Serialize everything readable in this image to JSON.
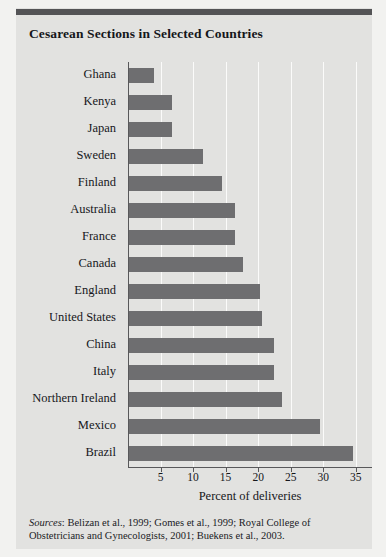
{
  "title": "Cesarean Sections in Selected Countries",
  "sources": {
    "label": "Sources",
    "text": ": Belizan et al., 1999; Gomes et al., 1999; Royal College of Obstetricians and Gynecologists, 2001; Buekens et al., 2003."
  },
  "colors": {
    "bar": "#6e6e70",
    "panel": "#e2e2e0",
    "page": "#f2f2f0",
    "rule": "#545456",
    "gridline": "#fbfbfa",
    "axis": "#58585a",
    "text": "#16171b"
  },
  "chart_data": {
    "type": "bar",
    "orientation": "horizontal",
    "title": "Cesarean Sections in Selected Countries",
    "xlabel": "Percent of deliveries",
    "ylabel": "",
    "xlim": [
      0,
      37.5
    ],
    "xticks": [
      5,
      10,
      15,
      20,
      25,
      30,
      35
    ],
    "grid": true,
    "legend": "none",
    "categories": [
      "Ghana",
      "Kenya",
      "Japan",
      "Sweden",
      "Finland",
      "Australia",
      "France",
      "Canada",
      "England",
      "United States",
      "China",
      "Italy",
      "Northern Ireland",
      "Mexico",
      "Brazil"
    ],
    "values": [
      4.0,
      6.8,
      6.8,
      11.5,
      14.5,
      16.5,
      16.5,
      17.6,
      20.3,
      20.6,
      22.5,
      22.5,
      23.7,
      29.5,
      34.6
    ]
  }
}
